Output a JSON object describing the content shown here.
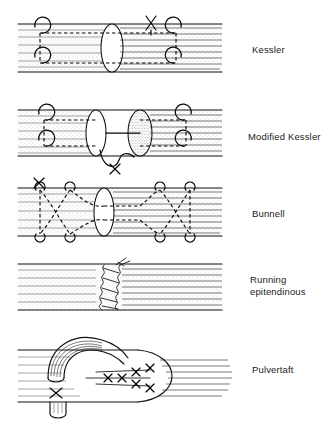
{
  "figure": {
    "background_color": "#ffffff",
    "ink_color": "#111111",
    "style": "black and white line drawing"
  },
  "panels": [
    {
      "id": "kessler",
      "label": "Kessler",
      "index": 1,
      "description": "Two tendon ends with a core suture; grasping loops at four corners, dashed intratendinous path, knot shown as an X above the repair site.",
      "cut_face_shaded": false,
      "knot_marker": "X"
    },
    {
      "id": "modified-kessler",
      "label": "Modified Kessler",
      "index": 2,
      "description": "Core suture with the knot buried between the tendon ends; the distal cut face is stippled, a looped suture with a knot hangs below the repair.",
      "cut_face_shaded": true,
      "knot_marker": "X"
    },
    {
      "id": "bunnell",
      "label": "Bunnell",
      "index": 3,
      "description": "Criss-cross crisscrossing dashed suture weaving diagonally through both tendon ends with grasping loops along the top and bottom margins.",
      "cut_face_shaded": false,
      "knot_marker": "X"
    },
    {
      "id": "running-epitendinous",
      "label": "Running\nepitendinous",
      "index": 4,
      "description": "Continuous running stitch placed circumferentially around the repair site, shown as a scalloped wavy line along the junction of the two tendon ends.",
      "cut_face_shaded": false,
      "knot_marker": ""
    },
    {
      "id": "pulvertaft",
      "label": "Pulvertaft",
      "index": 5,
      "description": "Weave repair: one tendon is passed through slits in the other and secured with multiple cross stitches; a trimmed tendon stub and an X knot lie below.",
      "cut_face_shaded": false,
      "knot_marker": "X"
    }
  ]
}
